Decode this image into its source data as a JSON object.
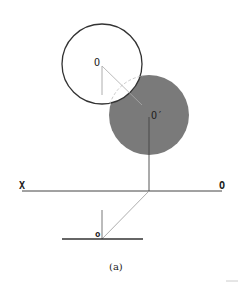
{
  "figure": {
    "caption": "(a)",
    "labels": {
      "center_top": "O",
      "center_shifted": "O′",
      "axis_left": "X",
      "axis_right": "O",
      "bottom_point": "o"
    },
    "colors": {
      "background": "#ffffff",
      "stroke": "#333333",
      "thin_stroke": "#888888",
      "filled_circle": "#7a7a7a",
      "dashed_arc": "#bbbbbb"
    },
    "geometry": {
      "white_circle": {
        "cx": 102,
        "cy": 64,
        "r": 40
      },
      "gray_circle": {
        "cx": 149,
        "cy": 115,
        "r": 40
      },
      "axis_line": {
        "x1": 22,
        "y1": 191,
        "x2": 222,
        "y2": 191
      },
      "ground_line": {
        "x1": 62,
        "y1": 239,
        "x2": 143,
        "y2": 239
      }
    }
  }
}
